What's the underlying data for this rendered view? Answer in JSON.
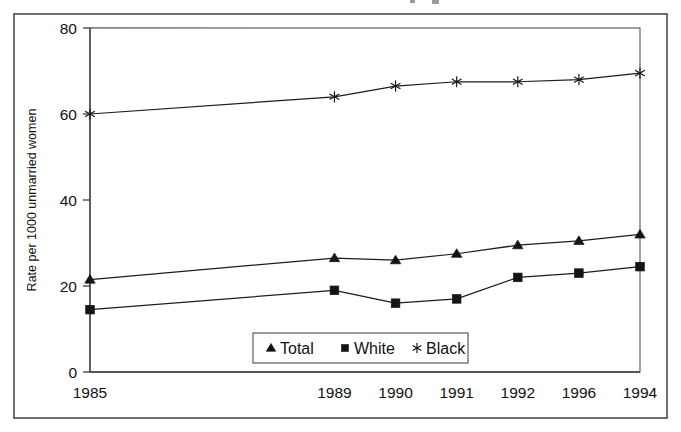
{
  "chart_data": {
    "type": "line",
    "title": "",
    "xlabel": "",
    "ylabel": "Rate per 1000 unmarried women",
    "categories": [
      "1985",
      "1989",
      "1990",
      "1991",
      "1992",
      "1996",
      "1994"
    ],
    "category_positions": [
      0,
      4,
      5,
      6,
      7,
      8,
      9
    ],
    "xlim": [
      0,
      9
    ],
    "ylim": [
      0,
      80
    ],
    "yticks": [
      0,
      20,
      40,
      60,
      80
    ],
    "ytick_labels": [
      "0",
      "20",
      "40",
      "60",
      "80"
    ],
    "grid": "horizontal",
    "legend_position": "bottom-center",
    "series": [
      {
        "name": "Total",
        "marker": "triangle",
        "values": [
          21.5,
          26.5,
          26.0,
          27.5,
          29.5,
          30.5,
          32.0
        ]
      },
      {
        "name": "White",
        "marker": "square",
        "values": [
          14.5,
          19.0,
          16.0,
          17.0,
          22.0,
          23.0,
          24.5
        ]
      },
      {
        "name": "Black",
        "marker": "star",
        "values": [
          60.0,
          64.0,
          66.5,
          67.5,
          67.5,
          68.0,
          69.5
        ]
      }
    ]
  },
  "legend": {
    "entries": [
      {
        "label": "Total",
        "marker": "triangle"
      },
      {
        "label": "White",
        "marker": "square"
      },
      {
        "label": "Black",
        "marker": "star"
      }
    ]
  },
  "colors": {
    "line": "#1d1d1d",
    "marker": "#141414",
    "grid": "#6d6d6d",
    "axis": "#3d3d3d",
    "frame": "#4a4a4a",
    "background": "#ffffff"
  }
}
